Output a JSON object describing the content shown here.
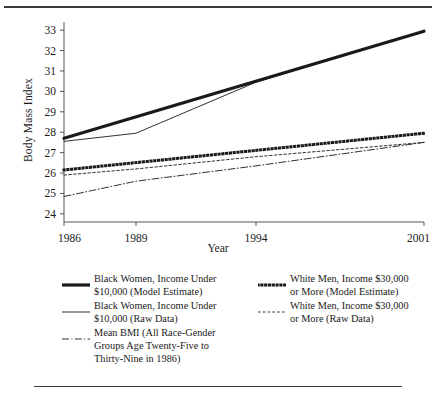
{
  "chart_data": {
    "type": "line",
    "title": "",
    "xlabel": "Year",
    "ylabel": "Body Mass Index",
    "x": [
      1986,
      1989,
      1994,
      2001
    ],
    "xticklabels": [
      "1986",
      "1989",
      "1994",
      "2001"
    ],
    "xlim": [
      1986,
      2001
    ],
    "ylim": [
      23.6,
      33.4
    ],
    "yticks": [
      24,
      25,
      26,
      27,
      28,
      29,
      30,
      31,
      32,
      33
    ],
    "yticklabels": [
      "24",
      "25",
      "26",
      "27",
      "28",
      "29",
      "30",
      "31",
      "32",
      "33"
    ],
    "grid": false,
    "legend_position": "below",
    "series": [
      {
        "name": "Black Women, Income Under $10,000 (Model Estimate)",
        "style": "thick-solid",
        "x": [
          1986,
          2001
        ],
        "values": [
          27.7,
          32.95
        ]
      },
      {
        "name": "Black Women, Income Under $10,000 (Raw Data)",
        "style": "thin-solid",
        "x": [
          1986,
          1989,
          1994,
          2001
        ],
        "values": [
          27.55,
          27.95,
          30.45,
          32.95
        ]
      },
      {
        "name": "White Men, Income $30,000 or More (Model Estimate)",
        "style": "thick-dotted",
        "x": [
          1986,
          2001
        ],
        "values": [
          26.15,
          27.95
        ]
      },
      {
        "name": "White Men, Income $30,000 or More (Raw Data)",
        "style": "thin-dashed",
        "x": [
          1986,
          1989,
          1994,
          2001
        ],
        "values": [
          25.9,
          26.2,
          26.8,
          27.5
        ]
      },
      {
        "name": "Mean BMI (All Race-Gender Groups Age Twenty-Five to Thirty-Nine in 1986)",
        "style": "thin-dashdot",
        "x": [
          1986,
          1989,
          1994,
          2001
        ],
        "values": [
          24.85,
          25.6,
          26.35,
          27.5
        ]
      }
    ]
  },
  "legend": {
    "left": [
      {
        "line1": "Black Women, Income Under",
        "line2": "$10,000 (Model Estimate)",
        "line3": "",
        "style": "thick-solid"
      },
      {
        "line1": "Black Women, Income Under",
        "line2": "$10,000 (Raw Data)",
        "line3": "",
        "style": "thin-solid"
      },
      {
        "line1": "Mean BMI (All Race-Gender",
        "line2": "Groups Age Twenty-Five to",
        "line3": "Thirty-Nine in 1986)",
        "style": "thin-dashdot"
      }
    ],
    "right": [
      {
        "line1": "White Men, Income $30,000",
        "line2": "or More (Model Estimate)",
        "line3": "",
        "style": "thick-dotted"
      },
      {
        "line1": "White Men, Income $30,000",
        "line2": "or More (Raw Data)",
        "line3": "",
        "style": "thin-dashed"
      }
    ]
  },
  "colors": {
    "ink": "#1a1a1a",
    "rule": "#3a3a3a",
    "axis": "#555555"
  }
}
